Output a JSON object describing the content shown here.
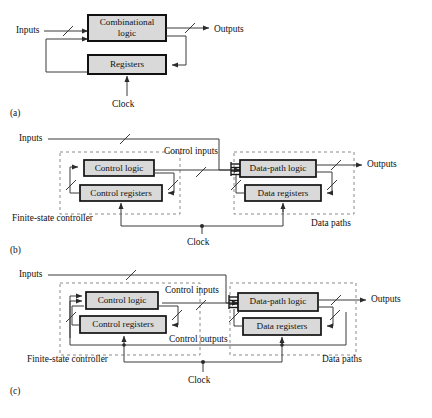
{
  "figure": {
    "background": "#ffffff",
    "line_color": "#3a3a3a",
    "block_border_color": "#111111",
    "block_fill_color": "#d9d9d9",
    "dashed_color": "#8a8a8a"
  },
  "panels": [
    {
      "id": "a",
      "letter": "(a)",
      "blocks": [
        {
          "id": "comb-logic",
          "label": "Combinational",
          "label2": "logic"
        },
        {
          "id": "registers",
          "label": "Registers"
        }
      ],
      "labels": {
        "inputs": "Inputs",
        "outputs": "Outputs",
        "clock": "Clock"
      }
    },
    {
      "id": "b",
      "letter": "(b)",
      "blocks": [
        {
          "id": "control-logic",
          "label": "Control logic"
        },
        {
          "id": "control-registers",
          "label": "Control registers"
        },
        {
          "id": "data-path-logic",
          "label": "Data-path logic"
        },
        {
          "id": "data-registers",
          "label": "Data registers"
        }
      ],
      "labels": {
        "inputs": "Inputs",
        "outputs": "Outputs",
        "clock": "Clock",
        "control_inputs": "Control inputs",
        "finite_state_controller": "Finite-state controller",
        "data_paths": "Data paths"
      }
    },
    {
      "id": "c",
      "letter": "(c)",
      "blocks": [
        {
          "id": "control-logic",
          "label": "Control logic"
        },
        {
          "id": "control-registers",
          "label": "Control registers"
        },
        {
          "id": "data-path-logic",
          "label": "Data-path logic"
        },
        {
          "id": "data-registers",
          "label": "Data registers"
        }
      ],
      "labels": {
        "inputs": "Inputs",
        "outputs": "Outputs",
        "clock": "Clock",
        "control_inputs": "Control inputs",
        "control_outputs": "Control outputs",
        "finite_state_controller": "Finite-state controller",
        "data_paths": "Data paths"
      }
    }
  ]
}
